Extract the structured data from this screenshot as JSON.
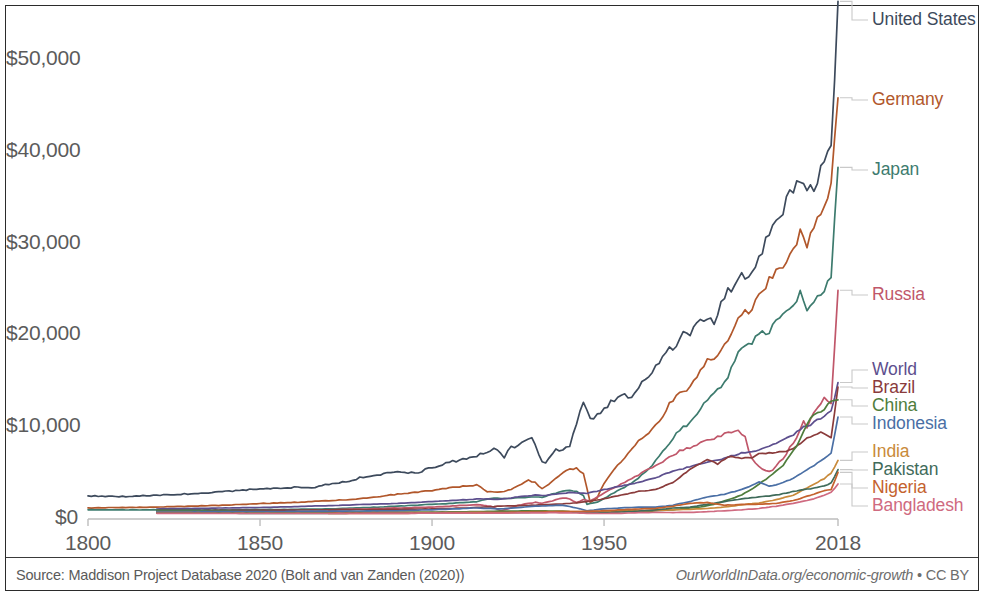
{
  "chart_data": {
    "type": "line",
    "title": "",
    "subtitle": "",
    "xlabel": "",
    "ylabel": "",
    "xlim": [
      1800,
      2018
    ],
    "ylim": [
      0,
      57000
    ],
    "grid": false,
    "legend_position": "right-direct-labels",
    "y_ticks": [
      "$0",
      "$10,000",
      "$20,000",
      "$30,000",
      "$40,000",
      "$50,000"
    ],
    "y_tick_values": [
      0,
      10000,
      20000,
      30000,
      40000,
      50000
    ],
    "x_ticks": [
      "1800",
      "1850",
      "1900",
      "1950",
      "2018"
    ],
    "x_tick_values": [
      1800,
      1850,
      1900,
      1950,
      2018
    ],
    "series": [
      {
        "name": "United States",
        "color": "#3d4a5c",
        "label_y": 20,
        "x": [
          1800,
          1810,
          1820,
          1830,
          1840,
          1850,
          1855,
          1860,
          1865,
          1870,
          1875,
          1880,
          1885,
          1890,
          1893,
          1896,
          1900,
          1905,
          1910,
          1913,
          1916,
          1918,
          1920,
          1921,
          1923,
          1925,
          1929,
          1930,
          1932,
          1933,
          1936,
          1938,
          1940,
          1942,
          1944,
          1946,
          1948,
          1950,
          1953,
          1955,
          1958,
          1960,
          1963,
          1966,
          1969,
          1970,
          1973,
          1975,
          1978,
          1980,
          1982,
          1984,
          1987,
          1990,
          1992,
          1995,
          1998,
          2000,
          2002,
          2005,
          2007,
          2009,
          2011,
          2014,
          2016,
          2018
        ],
        "y": [
          2500,
          2450,
          2600,
          2750,
          3000,
          3300,
          3350,
          3450,
          3400,
          3800,
          4050,
          4600,
          4800,
          5200,
          5000,
          5100,
          5600,
          6200,
          6500,
          6900,
          7400,
          7600,
          7300,
          6800,
          7800,
          8000,
          8800,
          8000,
          6300,
          6200,
          7600,
          7400,
          8000,
          10500,
          12900,
          10900,
          11200,
          12000,
          13000,
          13500,
          13200,
          14500,
          15400,
          17200,
          18700,
          18500,
          20200,
          19800,
          21800,
          22000,
          21500,
          23600,
          25200,
          26500,
          26800,
          28500,
          31000,
          33000,
          33800,
          36200,
          37500,
          35500,
          36200,
          38500,
          41000,
          55500
        ]
      },
      {
        "name": "Germany",
        "color": "#b1572b",
        "label_y": 100,
        "x": [
          1800,
          1810,
          1820,
          1830,
          1840,
          1850,
          1860,
          1870,
          1875,
          1880,
          1885,
          1890,
          1895,
          1900,
          1905,
          1910,
          1913,
          1916,
          1919,
          1922,
          1925,
          1928,
          1930,
          1932,
          1934,
          1936,
          1938,
          1940,
          1942,
          1944,
          1946,
          1948,
          1950,
          1953,
          1955,
          1958,
          1960,
          1963,
          1966,
          1969,
          1972,
          1975,
          1978,
          1980,
          1983,
          1986,
          1989,
          1991,
          1993,
          1995,
          1998,
          2001,
          2004,
          2007,
          2009,
          2011,
          2014,
          2016,
          2018
        ],
        "y": [
          1200,
          1250,
          1300,
          1400,
          1500,
          1700,
          1800,
          2000,
          2100,
          2250,
          2450,
          2700,
          2900,
          3100,
          3400,
          3600,
          3700,
          3000,
          2900,
          3100,
          3600,
          4200,
          4000,
          3300,
          3800,
          4400,
          5000,
          5400,
          5500,
          5000,
          1800,
          2300,
          3900,
          5400,
          6300,
          7600,
          8500,
          9500,
          10500,
          12500,
          13800,
          14300,
          16300,
          17200,
          17800,
          19500,
          21800,
          22500,
          22800,
          24200,
          26000,
          27500,
          28500,
          31200,
          29500,
          32000,
          33500,
          36000,
          46000
        ]
      },
      {
        "name": "Japan",
        "color": "#3d7b6e",
        "label_y": 170,
        "x": [
          1800,
          1820,
          1840,
          1860,
          1870,
          1875,
          1880,
          1885,
          1890,
          1895,
          1900,
          1905,
          1910,
          1913,
          1918,
          1920,
          1925,
          1930,
          1932,
          1935,
          1938,
          1940,
          1942,
          1944,
          1945,
          1946,
          1948,
          1950,
          1953,
          1955,
          1958,
          1960,
          1963,
          1966,
          1969,
          1972,
          1975,
          1978,
          1980,
          1983,
          1986,
          1989,
          1991,
          1993,
          1995,
          1998,
          2001,
          2004,
          2007,
          2009,
          2011,
          2014,
          2016,
          2018
        ],
        "y": [
          1000,
          1000,
          1000,
          1050,
          1100,
          1150,
          1250,
          1300,
          1400,
          1500,
          1600,
          1700,
          1800,
          1900,
          2300,
          2200,
          2300,
          2400,
          2350,
          2700,
          3000,
          3100,
          3000,
          2600,
          1600,
          1700,
          1800,
          2200,
          2900,
          3300,
          3900,
          4500,
          5500,
          6800,
          8200,
          9800,
          10400,
          12100,
          13000,
          14000,
          15500,
          18000,
          19200,
          19300,
          20000,
          20500,
          21800,
          23000,
          24500,
          22800,
          23500,
          25000,
          26500,
          38500
        ]
      },
      {
        "name": "Russia",
        "color": "#c0576a",
        "label_y": 295,
        "x": [
          1870,
          1880,
          1890,
          1900,
          1910,
          1913,
          1917,
          1920,
          1922,
          1925,
          1928,
          1930,
          1932,
          1935,
          1938,
          1940,
          1942,
          1944,
          1946,
          1948,
          1950,
          1953,
          1956,
          1960,
          1964,
          1968,
          1972,
          1975,
          1978,
          1980,
          1983,
          1986,
          1989,
          1991,
          1992,
          1994,
          1996,
          1998,
          2000,
          2003,
          2006,
          2008,
          2009,
          2011,
          2014,
          2016,
          2018
        ],
        "y": [
          1000,
          1100,
          1200,
          1300,
          1500,
          1550,
          1400,
          900,
          1100,
          1500,
          1700,
          1800,
          1700,
          2000,
          2300,
          2200,
          1800,
          2100,
          2000,
          2400,
          2800,
          3400,
          4000,
          4800,
          5600,
          6500,
          7400,
          7800,
          8200,
          8600,
          8900,
          9400,
          9600,
          9000,
          7400,
          6000,
          5400,
          5100,
          5700,
          7100,
          9000,
          10800,
          9900,
          11500,
          13200,
          12700,
          24500
        ]
      },
      {
        "name": "World",
        "color": "#5d4f8e",
        "label_y": 370,
        "x": [
          1820,
          1850,
          1870,
          1890,
          1900,
          1910,
          1913,
          1920,
          1925,
          1930,
          1933,
          1938,
          1940,
          1945,
          1950,
          1955,
          1960,
          1965,
          1970,
          1975,
          1980,
          1985,
          1990,
          1995,
          2000,
          2005,
          2008,
          2010,
          2013,
          2016,
          2018
        ],
        "y": [
          1100,
          1250,
          1450,
          1700,
          1900,
          2100,
          2200,
          2150,
          2400,
          2600,
          2550,
          2800,
          2900,
          2800,
          3200,
          3600,
          4000,
          4500,
          5200,
          5700,
          6200,
          6600,
          7200,
          7500,
          8200,
          9200,
          10000,
          10300,
          11000,
          11800,
          14800
        ]
      },
      {
        "name": "Brazil",
        "color": "#8a3b3b",
        "label_y": 388,
        "x": [
          1820,
          1850,
          1870,
          1890,
          1900,
          1910,
          1920,
          1930,
          1935,
          1940,
          1945,
          1950,
          1955,
          1960,
          1965,
          1970,
          1975,
          1980,
          1983,
          1986,
          1990,
          1993,
          1995,
          1998,
          2002,
          2005,
          2008,
          2010,
          2013,
          2016,
          2018
        ],
        "y": [
          900,
          950,
          1000,
          1050,
          1100,
          1200,
          1400,
          1500,
          1600,
          1700,
          1900,
          2200,
          2600,
          3000,
          3200,
          4000,
          5400,
          6500,
          6000,
          6800,
          6600,
          6700,
          7100,
          7200,
          7300,
          7600,
          8500,
          9000,
          9400,
          8900,
          14300
        ]
      },
      {
        "name": "China",
        "color": "#4f7d3c",
        "label_y": 406,
        "x": [
          1820,
          1850,
          1870,
          1890,
          1900,
          1913,
          1920,
          1930,
          1938,
          1945,
          1950,
          1955,
          1960,
          1962,
          1965,
          1970,
          1975,
          1978,
          1982,
          1986,
          1990,
          1994,
          1998,
          2002,
          2006,
          2010,
          2014,
          2016,
          2018
        ],
        "y": [
          950,
          800,
          750,
          750,
          750,
          800,
          850,
          900,
          850,
          700,
          700,
          850,
          950,
          800,
          900,
          1000,
          1200,
          1300,
          1600,
          2100,
          2600,
          3500,
          4600,
          5800,
          8000,
          11000,
          12000,
          12800,
          13100
        ]
      },
      {
        "name": "Indonesia",
        "color": "#4a6fa5",
        "label_y": 424,
        "x": [
          1820,
          1850,
          1870,
          1890,
          1900,
          1913,
          1920,
          1930,
          1938,
          1942,
          1945,
          1950,
          1955,
          1960,
          1965,
          1970,
          1975,
          1980,
          1985,
          1990,
          1995,
          1998,
          2000,
          2005,
          2010,
          2014,
          2016,
          2018
        ],
        "y": [
          800,
          800,
          850,
          900,
          1000,
          1200,
          1100,
          1400,
          1500,
          1200,
          900,
          1100,
          1200,
          1300,
          1300,
          1500,
          1900,
          2400,
          2700,
          3200,
          4000,
          3600,
          3700,
          4400,
          5600,
          6600,
          7200,
          11200
        ]
      },
      {
        "name": "India",
        "color": "#c98a3a",
        "label_y": 452,
        "x": [
          1820,
          1850,
          1870,
          1890,
          1900,
          1913,
          1920,
          1930,
          1938,
          1945,
          1950,
          1955,
          1960,
          1965,
          1970,
          1975,
          1980,
          1985,
          1990,
          1995,
          2000,
          2005,
          2010,
          2014,
          2016,
          2018
        ],
        "y": [
          700,
          650,
          650,
          700,
          700,
          750,
          700,
          800,
          800,
          800,
          800,
          850,
          900,
          950,
          1000,
          1050,
          1150,
          1300,
          1550,
          1750,
          2100,
          2600,
          3600,
          4400,
          5000,
          6400
        ]
      },
      {
        "name": "Pakistan",
        "color": "#3f6b5a",
        "label_y": 470,
        "x": [
          1820,
          1850,
          1870,
          1890,
          1900,
          1913,
          1920,
          1930,
          1938,
          1945,
          1950,
          1955,
          1960,
          1965,
          1970,
          1975,
          1980,
          1985,
          1990,
          1995,
          2000,
          2005,
          2010,
          2014,
          2016,
          2018
        ],
        "y": [
          650,
          620,
          620,
          650,
          680,
          700,
          700,
          750,
          760,
          740,
          700,
          760,
          850,
          1000,
          1200,
          1300,
          1600,
          1900,
          2200,
          2400,
          2600,
          3000,
          3300,
          3600,
          3900,
          5400
        ]
      },
      {
        "name": "Nigeria",
        "color": "#c4622e",
        "label_y": 488,
        "x": [
          1870,
          1890,
          1900,
          1913,
          1920,
          1930,
          1938,
          1945,
          1950,
          1955,
          1960,
          1965,
          1970,
          1975,
          1980,
          1985,
          1990,
          1995,
          2000,
          2005,
          2010,
          2014,
          2016,
          2018
        ],
        "y": [
          600,
          620,
          640,
          680,
          700,
          760,
          800,
          820,
          900,
          1000,
          1100,
          1150,
          1400,
          1700,
          1800,
          1500,
          1600,
          1600,
          1700,
          2000,
          2600,
          3100,
          3200,
          5100
        ]
      },
      {
        "name": "Bangladesh",
        "color": "#cf6a80",
        "label_y": 506,
        "x": [
          1820,
          1850,
          1870,
          1890,
          1900,
          1913,
          1920,
          1930,
          1938,
          1945,
          1950,
          1955,
          1960,
          1965,
          1970,
          1975,
          1980,
          1985,
          1990,
          1995,
          2000,
          2005,
          2010,
          2014,
          2016,
          2018
        ],
        "y": [
          620,
          600,
          600,
          620,
          640,
          650,
          640,
          680,
          680,
          620,
          600,
          620,
          680,
          720,
          700,
          720,
          800,
          900,
          1000,
          1150,
          1400,
          1700,
          2100,
          2600,
          2900,
          3800
        ]
      }
    ]
  },
  "footer": {
    "source": "Source: Maddison Project Database 2020 (Bolt and van Zanden (2020))",
    "attribution": "OurWorldInData.org/economic-growth",
    "separator": " • ",
    "license": "CC BY"
  }
}
